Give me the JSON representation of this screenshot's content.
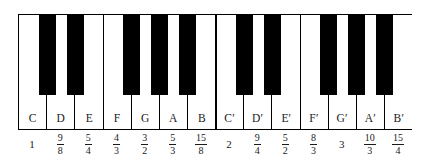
{
  "figure": {
    "ink_color": "#000000",
    "white_key_color": "#ffffff",
    "black_key_color": "#000000",
    "background_color": "#ffffff"
  },
  "keyboard": {
    "white_key_count": 14,
    "black_key_count": 10,
    "octave_groups": [
      {
        "name": "octave-1-lower",
        "notes": [
          "C",
          "D",
          "E"
        ],
        "black_keys": 2
      },
      {
        "name": "octave-1-upper",
        "notes": [
          "F",
          "G",
          "A",
          "B"
        ],
        "black_keys": 3
      },
      {
        "name": "octave-2-lower",
        "notes": [
          "C′",
          "D′",
          "E′"
        ],
        "black_keys": 2
      },
      {
        "name": "octave-2-upper",
        "notes": [
          "F′",
          "G′",
          "A′",
          "B′"
        ],
        "black_keys": 3
      }
    ],
    "keys": [
      {
        "note": "C",
        "ratio_kind": "integer",
        "ratio": "1",
        "num": "",
        "den": ""
      },
      {
        "note": "D",
        "ratio_kind": "fraction",
        "ratio": "9/8",
        "num": "9",
        "den": "8"
      },
      {
        "note": "E",
        "ratio_kind": "fraction",
        "ratio": "5/4",
        "num": "5",
        "den": "4"
      },
      {
        "note": "F",
        "ratio_kind": "fraction",
        "ratio": "4/3",
        "num": "4",
        "den": "3"
      },
      {
        "note": "G",
        "ratio_kind": "fraction",
        "ratio": "3/2",
        "num": "3",
        "den": "2"
      },
      {
        "note": "A",
        "ratio_kind": "fraction",
        "ratio": "5/3",
        "num": "5",
        "den": "3"
      },
      {
        "note": "B",
        "ratio_kind": "fraction",
        "ratio": "15/8",
        "num": "15",
        "den": "8"
      },
      {
        "note": "C′",
        "ratio_kind": "integer",
        "ratio": "2",
        "num": "",
        "den": ""
      },
      {
        "note": "D′",
        "ratio_kind": "fraction",
        "ratio": "9/4",
        "num": "9",
        "den": "4"
      },
      {
        "note": "E′",
        "ratio_kind": "fraction",
        "ratio": "5/2",
        "num": "5",
        "den": "2"
      },
      {
        "note": "F′",
        "ratio_kind": "fraction",
        "ratio": "8/3",
        "num": "8",
        "den": "3"
      },
      {
        "note": "G′",
        "ratio_kind": "integer",
        "ratio": "3",
        "num": "",
        "den": ""
      },
      {
        "note": "A′",
        "ratio_kind": "fraction",
        "ratio": "10/3",
        "num": "10",
        "den": "3"
      },
      {
        "note": "B′",
        "ratio_kind": "fraction",
        "ratio": "15/4",
        "num": "15",
        "den": "4"
      }
    ],
    "black_key_labels": [
      "C-sharp",
      "D-sharp",
      "F-sharp",
      "G-sharp",
      "A-sharp",
      "C-sharp-prime",
      "D-sharp-prime",
      "F-sharp-prime",
      "G-sharp-prime",
      "A-sharp-prime"
    ]
  },
  "chart_data": {
    "type": "table",
    "categories": [
      "C",
      "D",
      "E",
      "F",
      "G",
      "A",
      "B",
      "C′",
      "D′",
      "E′",
      "F′",
      "G′",
      "A′",
      "B′"
    ],
    "values": [
      1,
      1.125,
      1.25,
      1.3333,
      1.5,
      1.6667,
      1.875,
      2,
      2.25,
      2.5,
      2.6667,
      3,
      3.3333,
      3.75
    ],
    "value_labels": [
      "1",
      "9/8",
      "5/4",
      "4/3",
      "3/2",
      "5/3",
      "15/8",
      "2",
      "9/4",
      "5/2",
      "8/3",
      "3",
      "10/3",
      "15/4"
    ],
    "xlabel": "Note",
    "ylabel": "Frequency ratio to C"
  }
}
